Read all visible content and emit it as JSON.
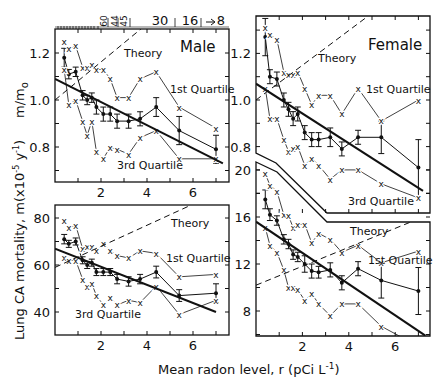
{
  "figure": {
    "x_axis_title": "Mean radon level, r (pCi L",
    "x_axis_title_sup": "-1",
    "x_axis_title_end": ")",
    "y_axis_title_upper": "m/m",
    "y_axis_title_upper_sub": "o",
    "y_axis_title_lower": "Lung CA mortality, m(x10",
    "y_axis_title_lower_sup": "-5",
    "y_axis_title_lower_mid": " y",
    "y_axis_title_lower_sup2": "-1",
    "y_axis_title_lower_end": ")",
    "top_axis_labels": [
      "60",
      "44",
      "45",
      "30",
      "16",
      "8"
    ]
  },
  "chart_data": [
    {
      "id": "male-relative",
      "type": "line",
      "title": "Male",
      "xlabel": "Mean radon level, r (pCi L^-1)",
      "ylabel": "m/m_o",
      "xlim": [
        0,
        7.5
      ],
      "ylim": [
        0.65,
        1.35
      ],
      "xticks": [
        2,
        4,
        6
      ],
      "yticks": [
        0.8,
        1.0,
        1.2
      ],
      "annotations": [
        "Theory",
        "1st Quartile",
        "3rd Quartile",
        "Male"
      ],
      "series": [
        {
          "name": "Mean",
          "style": "points-errorbars",
          "x": [
            0.4,
            0.6,
            0.9,
            1.2,
            1.4,
            1.6,
            1.8,
            2.1,
            2.4,
            2.7,
            3.2,
            3.7,
            4.4,
            5.4,
            7.0
          ],
          "y": [
            1.18,
            1.11,
            1.12,
            1.02,
            1.0,
            1.01,
            0.97,
            0.94,
            0.94,
            0.91,
            0.91,
            0.92,
            0.97,
            0.87,
            0.79
          ],
          "err": [
            0.04,
            0.02,
            0.02,
            0.02,
            0.02,
            0.02,
            0.03,
            0.03,
            0.03,
            0.03,
            0.03,
            0.03,
            0.04,
            0.06,
            0.06
          ]
        },
        {
          "name": "1st Quartile",
          "style": "x-markers",
          "x": [
            0.4,
            0.6,
            0.9,
            1.2,
            1.4,
            1.6,
            1.8,
            2.1,
            2.4,
            2.7,
            3.2,
            3.7,
            4.4,
            5.4,
            7.0
          ],
          "y": [
            1.25,
            1.22,
            1.23,
            1.14,
            1.14,
            1.15,
            1.13,
            1.13,
            1.09,
            1.01,
            1.01,
            1.09,
            1.12,
            0.97,
            0.88
          ]
        },
        {
          "name": "3rd Quartile",
          "style": "x-markers",
          "x": [
            0.4,
            0.6,
            0.9,
            1.2,
            1.4,
            1.6,
            1.8,
            2.1,
            2.4,
            2.7,
            3.2,
            3.7,
            4.4,
            5.4,
            7.0
          ],
          "y": [
            1.13,
            0.98,
            1.0,
            0.91,
            0.85,
            0.91,
            0.78,
            0.75,
            0.8,
            0.79,
            0.77,
            0.84,
            0.87,
            0.75,
            0.75
          ]
        },
        {
          "name": "Regression",
          "style": "thick-line",
          "x": [
            0.0,
            7.3
          ],
          "y": [
            1.09,
            0.73
          ]
        },
        {
          "name": "Theory",
          "style": "dashed",
          "x": [
            0.0,
            4.2
          ],
          "y": [
            1.0,
            1.34
          ]
        }
      ]
    },
    {
      "id": "male-absolute",
      "type": "line",
      "title": "",
      "xlabel": "Mean radon level, r (pCi L^-1)",
      "ylabel": "Lung CA mortality, m (x10^-5 y^-1)",
      "xlim": [
        0,
        7.5
      ],
      "ylim": [
        30,
        85
      ],
      "xticks": [
        2,
        4,
        6
      ],
      "yticks": [
        40,
        60,
        80
      ],
      "annotations": [
        "Theory",
        "1st Quartile",
        "3rd Quartile"
      ],
      "series": [
        {
          "name": "Mean",
          "style": "points-errorbars",
          "x": [
            0.4,
            0.6,
            0.9,
            1.2,
            1.4,
            1.6,
            1.8,
            2.1,
            2.4,
            2.7,
            3.2,
            3.7,
            4.4,
            5.4,
            7.0
          ],
          "y": [
            71,
            69,
            70,
            62,
            60,
            61,
            57,
            57,
            57,
            54,
            53,
            54,
            57,
            47,
            48
          ],
          "err": [
            2,
            1.5,
            1.5,
            1.5,
            1.5,
            1.5,
            1.5,
            1.5,
            1.5,
            2,
            2,
            2,
            2.5,
            2.5,
            4
          ]
        },
        {
          "name": "1st Quartile",
          "style": "x-markers",
          "x": [
            0.4,
            0.6,
            0.9,
            1.2,
            1.4,
            1.6,
            1.8,
            2.1,
            2.4,
            2.7,
            3.2,
            3.7,
            4.4,
            5.4,
            7.0
          ],
          "y": [
            79,
            76,
            77,
            67,
            68,
            68,
            66,
            69,
            66,
            64,
            63,
            66,
            65,
            55,
            56
          ]
        },
        {
          "name": "3rd Quartile",
          "style": "x-markers",
          "x": [
            0.4,
            0.6,
            0.9,
            1.2,
            1.4,
            1.6,
            1.8,
            2.1,
            2.4,
            2.7,
            3.2,
            3.7,
            4.4,
            5.4,
            7.0
          ],
          "y": [
            63,
            62,
            62,
            54,
            51,
            52,
            47,
            43,
            46,
            43,
            45,
            44,
            51,
            39,
            45
          ]
        },
        {
          "name": "Regression",
          "style": "thick-line",
          "x": [
            0.0,
            7.0
          ],
          "y": [
            67,
            40
          ]
        },
        {
          "name": "Theory",
          "style": "dashed",
          "x": [
            0.0,
            5.8
          ],
          "y": [
            59,
            85
          ]
        }
      ]
    },
    {
      "id": "female-relative",
      "type": "line",
      "title": "Female",
      "xlabel": "Mean radon level, r (pCi L^-1)",
      "ylabel": "m/m_o",
      "xlim": [
        0,
        7.5
      ],
      "ylim": [
        0.72,
        1.38
      ],
      "xticks": [
        2,
        4,
        6
      ],
      "yticks": [
        0.8,
        1.0,
        1.2
      ],
      "annotations": [
        "Theory",
        "1st Quartile",
        "3rd Quartile",
        "Female"
      ],
      "series": [
        {
          "name": "Mean",
          "style": "points-errorbars",
          "x": [
            0.4,
            0.6,
            0.9,
            1.2,
            1.4,
            1.6,
            1.8,
            2.1,
            2.4,
            2.7,
            3.2,
            3.7,
            4.4,
            5.4,
            7.0
          ],
          "y": [
            1.27,
            1.1,
            1.09,
            1.0,
            0.96,
            0.92,
            0.94,
            0.86,
            0.83,
            0.83,
            0.84,
            0.79,
            0.84,
            0.84,
            0.71
          ],
          "err": [
            0.08,
            0.03,
            0.03,
            0.03,
            0.03,
            0.03,
            0.03,
            0.03,
            0.03,
            0.03,
            0.04,
            0.03,
            0.03,
            0.07,
            0.12
          ]
        },
        {
          "name": "1st Quartile",
          "style": "x-markers",
          "x": [
            0.4,
            0.6,
            0.9,
            1.2,
            1.4,
            1.6,
            1.8,
            2.1,
            2.4,
            2.7,
            3.2,
            3.7,
            4.4,
            5.4,
            7.0
          ],
          "y": [
            1.31,
            1.28,
            1.26,
            1.12,
            1.11,
            1.11,
            1.12,
            1.05,
            0.98,
            1.02,
            1.02,
            0.94,
            1.05,
            0.91,
            1.0
          ]
        },
        {
          "name": "3rd Quartile",
          "style": "x-markers",
          "x": [
            0.4,
            0.6,
            0.9,
            1.2,
            1.4,
            1.6,
            1.8,
            2.1,
            2.4,
            2.7,
            3.2,
            3.7,
            4.4,
            5.4,
            7.0
          ],
          "y": [
            1.05,
            0.92,
            0.92,
            0.83,
            0.78,
            0.79,
            0.8,
            0.72,
            0.75,
            0.72,
            0.66,
            0.7,
            0.7,
            0.64,
            0.58
          ]
        },
        {
          "name": "Regression",
          "style": "thick-line",
          "x": [
            0.0,
            7.2
          ],
          "y": [
            1.07,
            0.61
          ]
        },
        {
          "name": "Theory",
          "style": "dashed",
          "x": [
            0.0,
            4.7
          ],
          "y": [
            1.0,
            1.35
          ]
        }
      ]
    },
    {
      "id": "female-absolute",
      "type": "line",
      "title": "",
      "xlabel": "Mean radon level, r (pCi L^-1)",
      "ylabel": "Lung CA mortality, m (x10^-5 y^-1)",
      "xlim": [
        0,
        7.5
      ],
      "ylim": [
        6,
        21.5
      ],
      "xticks": [
        2,
        4,
        6
      ],
      "yticks": [
        8,
        12,
        16,
        20
      ],
      "annotations": [
        "Theory",
        "1st Quartile",
        "3rd Quartile"
      ],
      "series": [
        {
          "name": "Mean",
          "style": "points-errorbars",
          "x": [
            0.4,
            0.6,
            0.9,
            1.2,
            1.4,
            1.6,
            1.8,
            2.1,
            2.4,
            2.7,
            3.2,
            3.7,
            4.4,
            5.4,
            7.0
          ],
          "y": [
            17.5,
            16.2,
            15.7,
            14.1,
            13.7,
            12.8,
            12.6,
            12.0,
            11.4,
            11.3,
            11.5,
            10.4,
            11.6,
            10.6,
            9.7
          ],
          "err": [
            0.8,
            0.5,
            0.4,
            0.4,
            0.4,
            0.4,
            0.4,
            0.7,
            0.6,
            0.5,
            0.6,
            0.6,
            0.6,
            1.5,
            2.0
          ]
        },
        {
          "name": "1st Quartile",
          "style": "x-markers",
          "x": [
            0.4,
            0.6,
            0.9,
            1.2,
            1.4,
            1.6,
            1.8,
            2.1,
            2.4,
            2.7,
            3.2,
            3.7,
            4.4,
            5.4,
            7.0
          ],
          "y": [
            19.7,
            18.7,
            18.2,
            16.2,
            16.1,
            15.1,
            15.4,
            15.4,
            13.8,
            14.6,
            14.1,
            13.0,
            13.6,
            12.1,
            13.1
          ]
        },
        {
          "name": "3rd Quartile",
          "style": "x-markers",
          "x": [
            0.4,
            0.6,
            0.9,
            1.2,
            1.4,
            1.6,
            1.8,
            2.1,
            2.4,
            2.7,
            3.2,
            3.7,
            4.4,
            5.4,
            7.0
          ],
          "y": [
            15.1,
            13.6,
            13.0,
            11.5,
            10.0,
            10.0,
            9.8,
            8.9,
            9.5,
            8.6,
            7.6,
            8.6,
            8.6,
            6.7,
            5.0
          ]
        },
        {
          "name": "Regression",
          "style": "thick-line",
          "x": [
            0.0,
            7.3
          ],
          "y": [
            15.6,
            5.9
          ]
        },
        {
          "name": "Theory",
          "style": "dashed",
          "x": [
            0.0,
            7.2
          ],
          "y": [
            10.2,
            16.0
          ]
        }
      ]
    }
  ]
}
